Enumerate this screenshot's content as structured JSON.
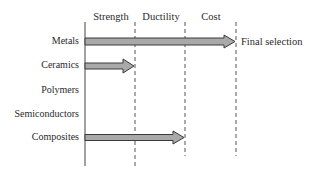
{
  "diagram": {
    "columns": [
      {
        "label": "Strength"
      },
      {
        "label": "Ductility"
      },
      {
        "label": "Cost"
      }
    ],
    "rows": [
      {
        "label": "Metals",
        "arrow_to_column": 3
      },
      {
        "label": "Ceramics",
        "arrow_to_column": 1
      },
      {
        "label": "Polymers",
        "arrow_to_column": 0
      },
      {
        "label": "Semiconductors",
        "arrow_to_column": 0
      },
      {
        "label": "Composites",
        "arrow_to_column": 2
      }
    ],
    "result_label": "Final selection",
    "colors": {
      "arrow_fill": "#a9a9a9",
      "arrow_stroke": "#3a3a3a",
      "line": "#444444"
    }
  }
}
